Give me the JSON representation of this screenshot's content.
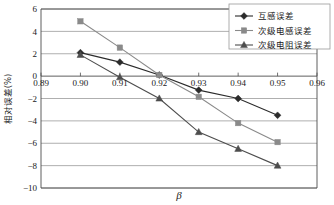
{
  "chart_data": {
    "type": "line",
    "title": "",
    "xlabel": "β",
    "ylabel": "相对误差(%)",
    "x": [
      0.9,
      0.91,
      0.92,
      0.93,
      0.94,
      0.95
    ],
    "xlim": [
      0.89,
      0.96
    ],
    "ylim": [
      -10,
      6
    ],
    "xticks": [
      "0.89",
      "0.90",
      "0.91",
      "0.92",
      "0.93",
      "0.94",
      "0.95",
      "0.96"
    ],
    "xtick_values": [
      0.89,
      0.9,
      0.91,
      0.92,
      0.93,
      0.94,
      0.95,
      0.96
    ],
    "yticks": [
      "6",
      "4",
      "2",
      "0",
      "-2",
      "-4",
      "-6",
      "-8",
      "-10"
    ],
    "ytick_values": [
      6,
      4,
      2,
      0,
      -2,
      -4,
      -6,
      -8,
      -10
    ],
    "grid": "horizontal",
    "legend_position": "top-right",
    "series": [
      {
        "name": "互感误差",
        "marker": "diamond",
        "color": "#2b2b2b",
        "values": [
          2.1,
          1.25,
          0.1,
          -1.25,
          -2.0,
          -3.5
        ]
      },
      {
        "name": "次级电感误差",
        "marker": "square",
        "color": "#8a8a8a",
        "values": [
          4.9,
          2.55,
          0.1,
          -1.85,
          -4.2,
          -5.9
        ]
      },
      {
        "name": "次级电阻误差",
        "marker": "triangle",
        "color": "#4d4d4d",
        "values": [
          1.9,
          -0.1,
          -2.0,
          -5.0,
          -6.5,
          -8.0
        ]
      }
    ]
  },
  "colors": {
    "axis": "#4d4d4d",
    "grid": "#9a9a9a",
    "background": "#ffffff",
    "text": "#1a1a1a"
  }
}
